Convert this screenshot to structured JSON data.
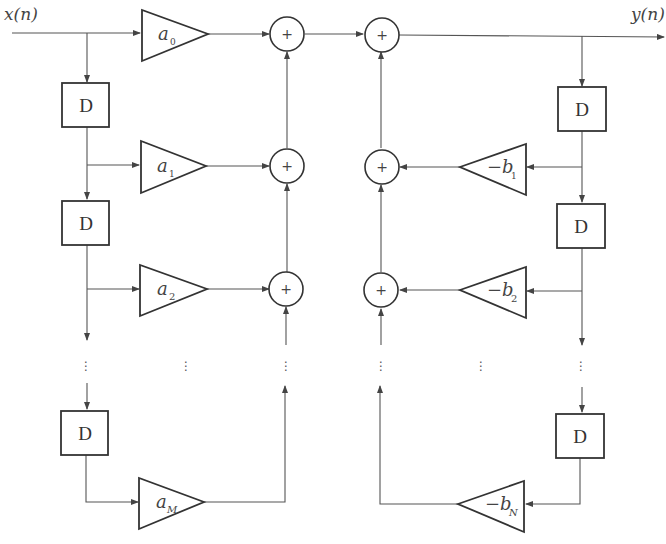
{
  "diagram": {
    "type": "block-diagram",
    "input_label": "x(n)",
    "output_label": "y(n)",
    "delay_label": "D",
    "adder_symbol": "+",
    "ellipsis": "⋮",
    "feedforward_gains": [
      {
        "base": "a",
        "sub": "0"
      },
      {
        "base": "a",
        "sub": "1"
      },
      {
        "base": "a",
        "sub": "2"
      },
      {
        "base": "a",
        "sub": "M"
      }
    ],
    "feedback_gains": [
      {
        "base": "−b",
        "sub": "1"
      },
      {
        "base": "−b",
        "sub": "2"
      },
      {
        "base": "−b",
        "sub": "N"
      }
    ],
    "colors": {
      "line": "#555555",
      "block": "#333333",
      "background": "#ffffff"
    }
  }
}
